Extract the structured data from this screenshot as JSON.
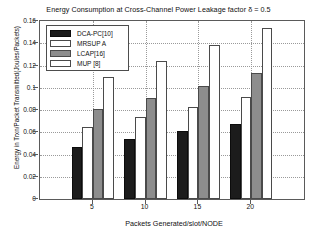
{
  "chart_data": {
    "type": "bar",
    "title": "Energy Consumption at Cross-Channel Power Leakage factor δ = 0.5",
    "xlabel": "Packets Generated/slot/NODE",
    "ylabel": "Energy in Trxn/Packet Transmitted(Joules/Packets)",
    "categories": [
      "5",
      "10",
      "15",
      "20"
    ],
    "series": [
      {
        "name": "DCA-PC[10]",
        "color": "#1c1c1c",
        "values": [
          0.047,
          0.054,
          0.061,
          0.067
        ]
      },
      {
        "name": "MRSUP A",
        "color": "#ffffff",
        "values": [
          0.065,
          0.074,
          0.083,
          0.092
        ]
      },
      {
        "name": "LCAP[16]",
        "color": "#8d8d8d",
        "values": [
          0.081,
          0.091,
          0.102,
          0.113
        ]
      },
      {
        "name": "MUP [8]",
        "color": "#ffffff",
        "values": [
          0.11,
          0.124,
          0.138,
          0.154
        ]
      }
    ],
    "ylim": [
      0,
      0.16
    ],
    "yticks": [
      "0",
      "0.02",
      "0.04",
      "0.06",
      "0.08",
      "0.1",
      "0.12",
      "0.14",
      "0.16"
    ],
    "ytick_values": [
      0,
      0.02,
      0.04,
      0.06,
      0.08,
      0.1,
      0.12,
      0.14,
      0.16
    ],
    "xlim": [
      0,
      5
    ],
    "grid": true,
    "legend_position": "upper left"
  }
}
